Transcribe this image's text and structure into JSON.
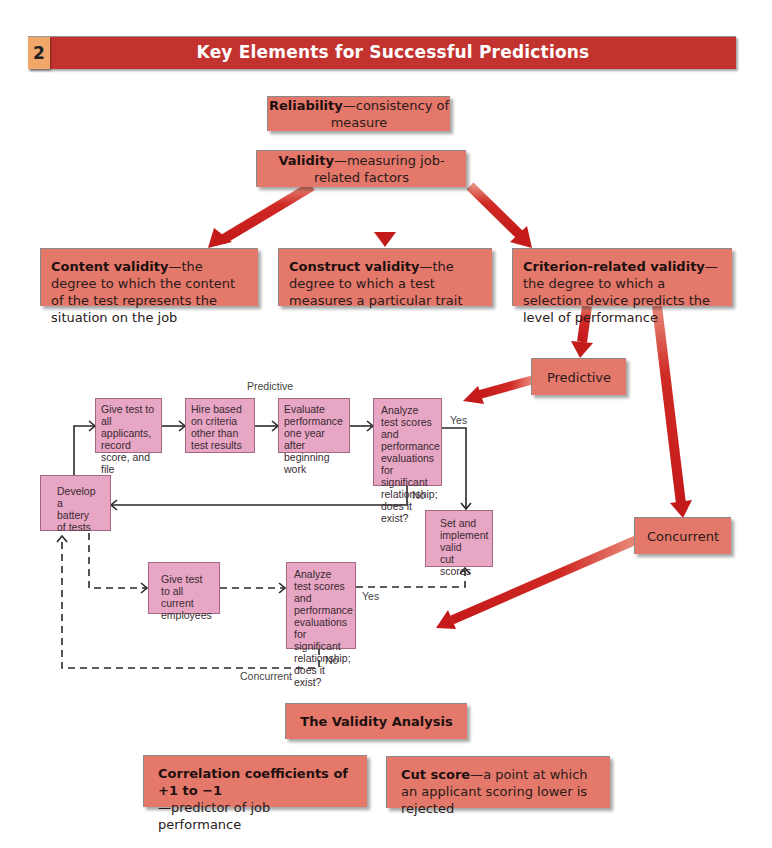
{
  "header": {
    "number": "2",
    "title": "Key Elements for Successful Predictions",
    "bar_color": "#c2332f",
    "number_color": "#f2a76a"
  },
  "concepts": {
    "reliability": {
      "term": "Reliability",
      "definition": "—consistency of measure"
    },
    "validity": {
      "term": "Validity",
      "definition": "—measuring job-related factors"
    },
    "content_validity": {
      "term": "Content validity",
      "definition": "—the degree to which the content of the test represents the situation on the job"
    },
    "construct_validity": {
      "term": "Construct validity",
      "definition": "—the degree to which a test measures a particular trait"
    },
    "criterion_validity": {
      "term": "Criterion-related validity",
      "definition": "—the degree to which a selection device predicts the level of performance"
    },
    "predictive": "Predictive",
    "concurrent": "Concurrent"
  },
  "flowchart": {
    "predictive_label": "Predictive",
    "concurrent_label": "Concurrent",
    "yes_top": "Yes",
    "no_top": "No",
    "yes_bottom": "Yes",
    "no_bottom": "No",
    "boxes": {
      "develop": "Develop a battery of tests",
      "give_applicants": "Give test to all applicants, record score, and file",
      "hire": "Hire based on criteria other than test results",
      "evaluate": "Evaluate performance one year after beginning work",
      "analyze_top": "Analyze test scores and performance evaluations for significant relationship; does it exist?",
      "set_cut": "Set and implement valid cut scores",
      "give_current": "Give test to all current employees",
      "analyze_bottom": "Analyze test scores and performance evaluations for significant relationship; does it exist?"
    }
  },
  "analysis": {
    "title": "The Validity Analysis",
    "correlation": {
      "term": "Correlation coefficients of +1 to −1",
      "definition": "—predictor of job performance"
    },
    "cut_score": {
      "term": "Cut score",
      "definition": "—a point at which an applicant scoring lower is rejected"
    }
  },
  "colors": {
    "salmon_box": "#e4786a",
    "pink_box": "#e7a6c3",
    "arrow_red": "#c81e1e"
  }
}
